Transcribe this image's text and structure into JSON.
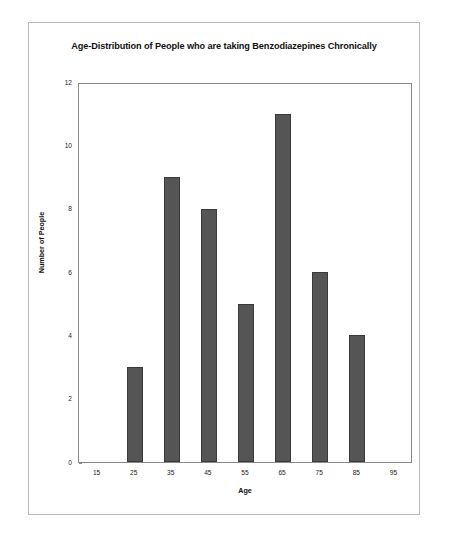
{
  "chart_data": {
    "type": "bar",
    "title": "Age-Distribution of People who are taking Benzodiazepines Chronically",
    "xlabel": "Age",
    "ylabel": "Number of People",
    "categories": [
      "15",
      "25",
      "35",
      "45",
      "55",
      "65",
      "75",
      "85",
      "95"
    ],
    "values": [
      0,
      3,
      9,
      8,
      5,
      11,
      6,
      4,
      0
    ],
    "x_tick_labels": [
      "15",
      "25",
      "35",
      "45",
      "55",
      "65",
      "75",
      "85",
      "95"
    ],
    "y_tick_labels": [
      "0",
      "2",
      "4",
      "6",
      "8",
      "10",
      "12"
    ],
    "y_tick_values": [
      0,
      2,
      4,
      6,
      8,
      10,
      12
    ],
    "ylim": [
      0,
      12
    ],
    "xlim": [
      10,
      100
    ],
    "grid": false,
    "legend": false,
    "bar_color": "#555555",
    "bar_edge_color": "#3a3a3a",
    "axis_color": "#8a8a8a",
    "frame_color": "#b9b9b9",
    "series": [
      {
        "name": "Number of People",
        "values": [
          0,
          3,
          9,
          8,
          5,
          11,
          6,
          4,
          0
        ]
      }
    ],
    "points": [
      {
        "age": "15",
        "count": 0
      },
      {
        "age": "25",
        "count": 3
      },
      {
        "age": "35",
        "count": 9
      },
      {
        "age": "45",
        "count": 8
      },
      {
        "age": "55",
        "count": 5
      },
      {
        "age": "65",
        "count": 11
      },
      {
        "age": "75",
        "count": 6
      },
      {
        "age": "85",
        "count": 4
      },
      {
        "age": "95",
        "count": 0
      }
    ]
  }
}
